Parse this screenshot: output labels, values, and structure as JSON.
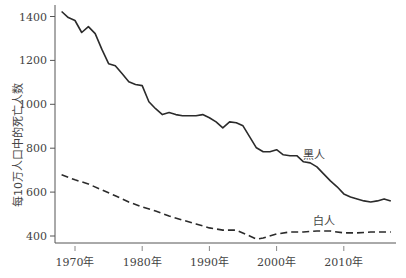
{
  "chart_data": {
    "type": "line",
    "title": "",
    "xlabel": "",
    "ylabel": "每10万人口中的死亡人数",
    "ylim": [
      380,
      1440
    ],
    "xlim": [
      1967,
      2018
    ],
    "grid": false,
    "legend": "inline labels",
    "y_ticks": [
      400,
      600,
      800,
      1000,
      1200,
      1400
    ],
    "x_ticks": [
      {
        "year": 1970,
        "label": "1970年"
      },
      {
        "year": 1980,
        "label": "1980年"
      },
      {
        "year": 1990,
        "label": "1990年"
      },
      {
        "year": 2000,
        "label": "2000年"
      },
      {
        "year": 2010,
        "label": "2010年"
      }
    ],
    "series": [
      {
        "name": "黑人",
        "style": "solid",
        "label_pos": {
          "x": 303,
          "y": 159
        },
        "x": [
          1968,
          1969,
          1970,
          1971,
          1972,
          1973,
          1974,
          1975,
          1976,
          1977,
          1978,
          1979,
          1980,
          1981,
          1982,
          1983,
          1984,
          1985,
          1986,
          1987,
          1988,
          1989,
          1990,
          1991,
          1992,
          1993,
          1994,
          1995,
          1996,
          1997,
          1998,
          1999,
          2000,
          2001,
          2002,
          2003,
          2004,
          2005,
          2006,
          2007,
          2008,
          2009,
          2010,
          2011,
          2012,
          2013,
          2014,
          2015,
          2016,
          2017
        ],
        "values": [
          1423,
          1395,
          1382,
          1327,
          1354,
          1322,
          1250,
          1185,
          1176,
          1140,
          1103,
          1090,
          1085,
          1012,
          980,
          953,
          962,
          953,
          948,
          948,
          948,
          953,
          939,
          920,
          893,
          920,
          916,
          902,
          852,
          802,
          784,
          784,
          793,
          770,
          766,
          766,
          738,
          733,
          715,
          683,
          651,
          624,
          592,
          578,
          569,
          560,
          555,
          560,
          569,
          560
        ]
      },
      {
        "name": "白人",
        "style": "dashed",
        "label_pos": {
          "x": 313,
          "y": 225
        },
        "x": [
          1968,
          1970,
          1972,
          1974,
          1976,
          1978,
          1980,
          1982,
          1984,
          1986,
          1988,
          1990,
          1992,
          1994,
          1996,
          1997,
          1998,
          2000,
          2002,
          2004,
          2006,
          2008,
          2010,
          2012,
          2014,
          2017
        ],
        "values": [
          679,
          656,
          637,
          610,
          583,
          555,
          532,
          514,
          491,
          473,
          455,
          437,
          427,
          427,
          400,
          386,
          391,
          409,
          418,
          418,
          423,
          423,
          414,
          414,
          418,
          418
        ]
      }
    ],
    "colors": {
      "line": "#2b2b2b",
      "axis": "#555555",
      "text": "#444444"
    }
  }
}
